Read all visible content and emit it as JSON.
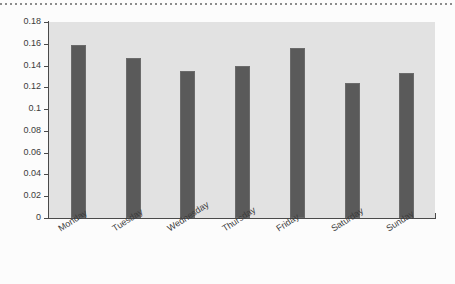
{
  "chart_data": {
    "type": "bar",
    "title": "",
    "subtitle": "",
    "xlabel": "",
    "ylabel": "",
    "categories": [
      "Monday",
      "Tuesday",
      "Wednesday",
      "Thursday",
      "Friday",
      "Saturday",
      "Sunday"
    ],
    "values": [
      0.159,
      0.147,
      0.135,
      0.14,
      0.156,
      0.124,
      0.133
    ],
    "ylim": [
      0,
      0.18
    ],
    "ytick_labels": [
      "0",
      "0.02",
      "0.04",
      "0.06",
      "0.08",
      "0.1",
      "0.12",
      "0.14",
      "0.16",
      "0.18"
    ],
    "ytick_values": [
      0,
      0.02,
      0.04,
      0.06,
      0.08,
      0.1,
      0.12,
      0.14,
      0.16,
      0.18
    ],
    "grid": false,
    "legend": null,
    "legend_position": "none",
    "annotations": [],
    "series": [
      {
        "name": "",
        "values": [
          0.159,
          0.147,
          0.135,
          0.14,
          0.156,
          0.124,
          0.133
        ]
      }
    ]
  },
  "style": {
    "bar_color": "#5a5a5a",
    "bar_edge_color": "#6b6b6b",
    "plot_background": "#e2e2e2",
    "figure_background": "#fcfcfc",
    "axis_color": "#4a4a4a",
    "tick_label_color": "#3b3b3b",
    "top_rule_color": "#8c8c8c",
    "xlabel_rotation_degrees": -33
  }
}
